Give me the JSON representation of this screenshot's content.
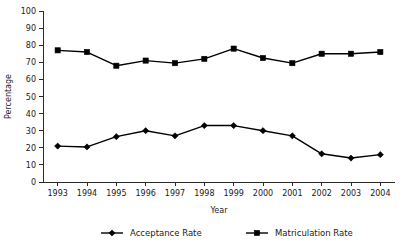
{
  "chart_data": {
    "type": "line",
    "title": "",
    "xlabel": "Year",
    "ylabel": "Percentage",
    "categories": [
      "1993",
      "1994",
      "1995",
      "1996",
      "1997",
      "1998",
      "1999",
      "2000",
      "2001",
      "2002",
      "2003",
      "2004"
    ],
    "x": [
      1993,
      1994,
      1995,
      1996,
      1997,
      1998,
      1999,
      2000,
      2001,
      2002,
      2003,
      2004
    ],
    "ylim": [
      0,
      100
    ],
    "ytick_step": 10,
    "yticks": [
      "100",
      "90",
      "80",
      "70",
      "60",
      "50",
      "40",
      "30",
      "20",
      "10",
      "0"
    ],
    "ytick_values": [
      100,
      90,
      80,
      70,
      60,
      50,
      40,
      30,
      20,
      10,
      0
    ],
    "grid": false,
    "legend_position": "bottom",
    "series": [
      {
        "name": "Acceptance Rate",
        "marker": "diamond",
        "color": "#000000",
        "values": [
          21,
          20.5,
          26.5,
          30,
          27,
          33,
          33,
          30,
          27,
          16.5,
          14,
          16
        ]
      },
      {
        "name": "Matriculation Rate",
        "marker": "square",
        "color": "#000000",
        "values": [
          77,
          76,
          68,
          71,
          69.5,
          72,
          78,
          72.5,
          69.5,
          75,
          75,
          76
        ]
      }
    ]
  },
  "legend": {
    "items": [
      {
        "label": "Acceptance Rate",
        "marker": "diamond"
      },
      {
        "label": "Matriculation Rate",
        "marker": "square"
      }
    ]
  }
}
